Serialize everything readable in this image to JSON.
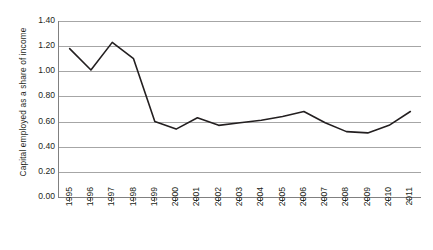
{
  "chart_data": {
    "type": "line",
    "title": "",
    "subtitle": "",
    "xlabel": "",
    "ylabel": "Capital employed as a share of income",
    "x": [
      1995,
      1996,
      1997,
      1998,
      1999,
      2000,
      2001,
      2002,
      2003,
      2004,
      2005,
      2006,
      2007,
      2008,
      2009,
      2010,
      2011
    ],
    "categories": [
      "1995",
      "1996",
      "1997",
      "1998",
      "1999",
      "2000",
      "2001",
      "2002",
      "2003",
      "2004",
      "2005",
      "2006",
      "2007",
      "2008",
      "2009",
      "2010",
      "2011"
    ],
    "values": [
      1.18,
      1.01,
      1.23,
      1.1,
      0.6,
      0.54,
      0.63,
      0.57,
      0.59,
      0.61,
      0.64,
      0.68,
      0.59,
      0.52,
      0.51,
      0.57,
      0.68
    ],
    "series": [
      {
        "name": "Capital employed as a share of income",
        "values": [
          1.18,
          1.01,
          1.23,
          1.1,
          0.6,
          0.54,
          0.63,
          0.57,
          0.59,
          0.61,
          0.64,
          0.68,
          0.59,
          0.52,
          0.51,
          0.57,
          0.68
        ],
        "color": "#231f20"
      }
    ],
    "ylim": [
      0.0,
      1.4
    ],
    "ytick_values": [
      0.0,
      0.2,
      0.4,
      0.6,
      0.8,
      1.0,
      1.2,
      1.4
    ],
    "ytick_labels": [
      "0.00",
      "0.20",
      "0.40",
      "0.60",
      "0.80",
      "1.00",
      "1.20",
      "1.40"
    ],
    "grid": "horizontal",
    "legend": "none",
    "legend_position": "none",
    "xtick_rotation": "vertical",
    "axis_color": "#808080",
    "gridline_color": "#a6a6a6",
    "line_color": "#231f20",
    "background_color": "#ffffff",
    "markers": "none"
  }
}
